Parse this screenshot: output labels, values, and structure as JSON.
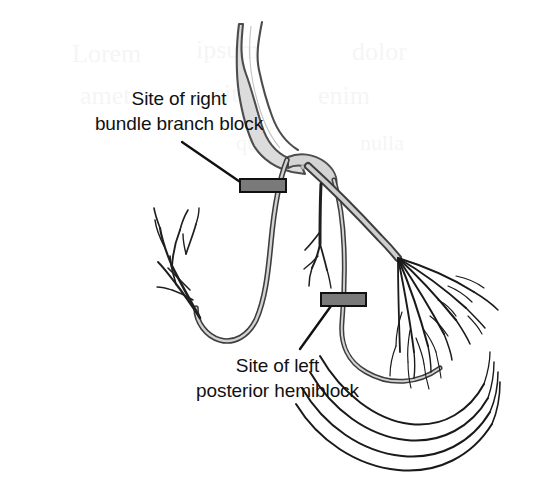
{
  "figure": {
    "name": "cardiac-conduction-system-block-sites",
    "background_color": "#ffffff"
  },
  "annotations": {
    "right_bundle_branch_block": {
      "line1": "Site of right",
      "line2": "bundle branch block",
      "leader_from": [
        182,
        142
      ],
      "leader_to": [
        246,
        186
      ],
      "marker_label": "block-marker-right-bundle"
    },
    "left_posterior_hemiblock": {
      "line1": "Site of left",
      "line2": "posterior hemiblock",
      "leader_from": [
        300,
        349
      ],
      "leader_to": [
        331,
        306
      ],
      "marker_label": "block-marker-left-posterior"
    }
  },
  "structures": {
    "his_bundle": "His bundle",
    "right_bundle_branch": "Right bundle branch",
    "left_bundle_branch": "Left bundle branch",
    "left_anterior_fascicle": "Left anterior fascicle",
    "left_posterior_fascicle": "Left posterior fascicle",
    "purkinje_fibers_left": "Purkinje fibers (right ventricle apex)",
    "purkinje_fibers_right": "Purkinje fibers (left ventricle)"
  },
  "colors": {
    "bundle_fill": "#d9d9d9",
    "bundle_fill_light": "#e6e6e6",
    "bundle_stroke": "#4a4a4a",
    "fiber_stroke": "#1a1a1a",
    "block_marker_fill": "#7a7a7a",
    "block_marker_stroke": "#111111",
    "leader_stroke": "#111111",
    "text": "#111111"
  },
  "block_markers": [
    {
      "name": "block-marker-right-bundle",
      "x": 240,
      "y": 179,
      "width": 46,
      "height": 13
    },
    {
      "name": "block-marker-left-posterior",
      "x": 321,
      "y": 293,
      "width": 45,
      "height": 13
    }
  ]
}
